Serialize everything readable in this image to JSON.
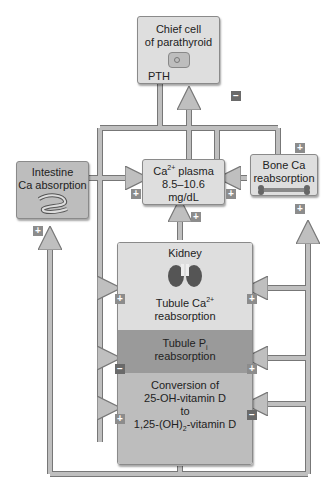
{
  "diagram": {
    "nodes": {
      "chief_cell": {
        "line1": "Chief cell",
        "line2": "of parathyroid",
        "hormone": "PTH"
      },
      "intestine": {
        "line1": "Intestine",
        "line2": "Ca absorption"
      },
      "plasma": {
        "ion": "Ca",
        "charge": "2+",
        "label": "plasma",
        "range": "8.5–10.6",
        "unit": "mg/dL"
      },
      "bone": {
        "line1": "Bone Ca",
        "line2": "reabsorption"
      },
      "kidney": {
        "title": "Kidney",
        "section1": {
          "line1_prefix": "Tubule Ca",
          "charge": "2+",
          "line2": "reabsorption"
        },
        "section2": {
          "line1_prefix": "Tubule P",
          "subscript": "i",
          "line2": "reabsorption"
        },
        "section3": {
          "line1": "Conversion of",
          "line2": "25-OH-vitamin D",
          "line3": "to",
          "line4_prefix": "1,25-(OH)",
          "line4_sub": "2",
          "line4_suffix": "-vitamin D"
        }
      }
    },
    "signs": {
      "plus": "+",
      "minus": "−"
    },
    "colors": {
      "light_box": "#dedede",
      "mid_box": "#bdbdbd",
      "dark_box": "#9a9a9a",
      "arrow": "#bfbfbf",
      "plus_badge": "#8c8c8c",
      "minus_badge": "#6a6a6a"
    }
  }
}
